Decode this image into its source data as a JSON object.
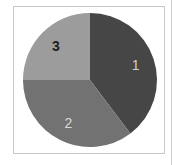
{
  "chart_data": {
    "type": "pie",
    "title": "",
    "categories": [
      "1",
      "2",
      "3"
    ],
    "values": [
      39.7,
      35.3,
      25.0
    ],
    "unit": "percent (estimated from angles)",
    "start_angle_deg": 0,
    "direction": "clockwise",
    "colors": [
      "#464646",
      "#727272",
      "#9c9c9c"
    ],
    "label_colors": [
      "#d0d0d0",
      "#d8d8d8",
      "#1e1e1e"
    ],
    "legend": "none",
    "labels_inside": true
  },
  "slices": [
    {
      "label": "1",
      "value": 39.7
    },
    {
      "label": "2",
      "value": 35.3
    },
    {
      "label": "3",
      "value": 25.0
    }
  ]
}
